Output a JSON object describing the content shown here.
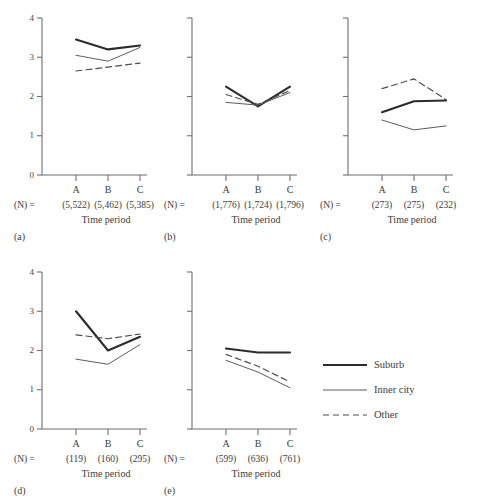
{
  "chart_data": {
    "type": "line",
    "title": "",
    "xlabel": "Time period",
    "ylabel": "",
    "categories": [
      "A",
      "B",
      "C"
    ],
    "ylim": [
      0,
      4
    ],
    "yticks": [
      0,
      1,
      2,
      3,
      4
    ],
    "ytick_labels": [
      "0",
      "1",
      "2",
      "3",
      "4"
    ],
    "grid": false,
    "legend_position": "right-middle",
    "legend": [
      {
        "name": "Suburb",
        "style": "solid-thick"
      },
      {
        "name": "Inner city",
        "style": "solid-thin"
      },
      {
        "name": "Other",
        "style": "dashed"
      }
    ],
    "n_prefix": "(N) =",
    "panels": [
      {
        "tag": "(a)",
        "show_ytick_labels": true,
        "n_values": [
          "(5,522)",
          "(5,462)",
          "(5,385)"
        ],
        "series": [
          {
            "name": "Suburb",
            "values": [
              3.45,
              3.2,
              3.3
            ]
          },
          {
            "name": "Inner city",
            "values": [
              3.05,
              2.9,
              3.25
            ]
          },
          {
            "name": "Other",
            "values": [
              2.65,
              2.75,
              2.85
            ]
          }
        ]
      },
      {
        "tag": "(b)",
        "show_ytick_labels": false,
        "n_values": [
          "(1,776)",
          "(1,724)",
          "(1,796)"
        ],
        "series": [
          {
            "name": "Suburb",
            "values": [
              2.25,
              1.75,
              2.25
            ]
          },
          {
            "name": "Inner city",
            "values": [
              1.85,
              1.78,
              2.1
            ]
          },
          {
            "name": "Other",
            "values": [
              2.05,
              1.8,
              2.15
            ]
          }
        ]
      },
      {
        "tag": "(c)",
        "show_ytick_labels": false,
        "n_values": [
          "(273)",
          "(275)",
          "(232)"
        ],
        "series": [
          {
            "name": "Suburb",
            "values": [
              1.6,
              1.88,
              1.9
            ]
          },
          {
            "name": "Inner city",
            "values": [
              1.4,
              1.15,
              1.25
            ]
          },
          {
            "name": "Other",
            "values": [
              2.2,
              2.45,
              1.92
            ]
          }
        ]
      },
      {
        "tag": "(d)",
        "show_ytick_labels": true,
        "n_values": [
          "(119)",
          "(160)",
          "(295)"
        ],
        "series": [
          {
            "name": "Suburb",
            "values": [
              3.0,
              2.0,
              2.35
            ]
          },
          {
            "name": "Inner city",
            "values": [
              1.78,
              1.65,
              2.15
            ]
          },
          {
            "name": "Other",
            "values": [
              2.4,
              2.3,
              2.42
            ]
          }
        ]
      },
      {
        "tag": "(e)",
        "show_ytick_labels": false,
        "n_values": [
          "(599)",
          "(636)",
          "(761)"
        ],
        "series": [
          {
            "name": "Suburb",
            "values": [
              2.05,
              1.95,
              1.95
            ]
          },
          {
            "name": "Inner city",
            "values": [
              1.75,
              1.45,
              1.05
            ]
          },
          {
            "name": "Other",
            "values": [
              1.9,
              1.6,
              1.2
            ]
          }
        ]
      }
    ]
  },
  "colors": {
    "suburb": "#2c2c2c",
    "inner_city": "#5d5d5d",
    "other": "#4d4d4d",
    "axis": "#6f6f6f",
    "background": "#ffffff"
  }
}
